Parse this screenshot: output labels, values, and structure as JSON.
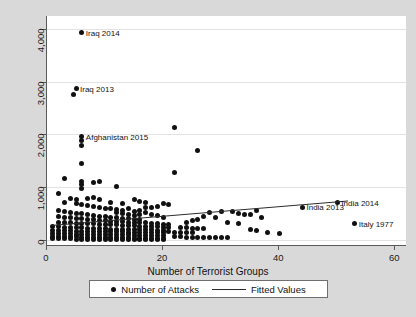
{
  "chart_data": {
    "type": "scatter",
    "title": "",
    "xlabel": "Number of Terrorist Groups",
    "ylabel": "",
    "xlim": [
      0,
      62
    ],
    "ylim": [
      -120,
      4250
    ],
    "grid": true,
    "xticks": [
      0,
      20,
      40,
      60
    ],
    "xtick_labels": [
      "0",
      "20",
      "40",
      "60"
    ],
    "yticks": [
      0,
      1000,
      2000,
      3000,
      4000
    ],
    "ytick_labels": [
      "0",
      "1,000",
      "2,000",
      "3,000",
      "4,000"
    ],
    "legend_position": "below-axes",
    "legend": [
      {
        "label": "Number of Attacks",
        "marker": "dot"
      },
      {
        "label": "Fitted Values",
        "marker": "line"
      }
    ],
    "series": [
      {
        "name": "Number of Attacks",
        "marker": "dot",
        "color": "#101010",
        "points": [
          [
            6,
            3930
          ],
          [
            5,
            2870
          ],
          [
            4.6,
            2760
          ],
          [
            6,
            1960
          ],
          [
            6,
            1880
          ],
          [
            6,
            1790
          ],
          [
            22,
            2130
          ],
          [
            26,
            1700
          ],
          [
            6,
            1440
          ],
          [
            22,
            1270
          ],
          [
            3,
            1170
          ],
          [
            6,
            1100
          ],
          [
            6,
            1050
          ],
          [
            8,
            1080
          ],
          [
            9,
            1110
          ],
          [
            12,
            1010
          ],
          [
            2,
            870
          ],
          [
            6,
            980
          ],
          [
            4,
            780
          ],
          [
            5,
            760
          ],
          [
            7,
            790
          ],
          [
            8,
            800
          ],
          [
            9,
            760
          ],
          [
            11,
            700
          ],
          [
            13,
            690
          ],
          [
            15,
            770
          ],
          [
            16,
            720
          ],
          [
            17,
            620
          ],
          [
            3,
            700
          ],
          [
            5,
            690
          ],
          [
            6,
            660
          ],
          [
            7,
            650
          ],
          [
            8,
            640
          ],
          [
            9,
            620
          ],
          [
            10,
            600
          ],
          [
            11,
            590
          ],
          [
            12,
            580
          ],
          [
            13,
            560
          ],
          [
            14,
            600
          ],
          [
            15,
            540
          ],
          [
            16,
            560
          ],
          [
            17,
            520
          ],
          [
            18,
            480
          ],
          [
            19,
            460
          ],
          [
            20,
            430
          ],
          [
            2,
            560
          ],
          [
            3,
            540
          ],
          [
            4,
            520
          ],
          [
            5,
            500
          ],
          [
            6,
            490
          ],
          [
            7,
            470
          ],
          [
            8,
            460
          ],
          [
            9,
            450
          ],
          [
            10,
            440
          ],
          [
            11,
            430
          ],
          [
            12,
            420
          ],
          [
            13,
            410
          ],
          [
            14,
            400
          ],
          [
            15,
            390
          ],
          [
            16,
            380
          ],
          [
            2,
            440
          ],
          [
            3,
            430
          ],
          [
            4,
            420
          ],
          [
            5,
            410
          ],
          [
            6,
            400
          ],
          [
            7,
            390
          ],
          [
            8,
            380
          ],
          [
            9,
            370
          ],
          [
            10,
            360
          ],
          [
            11,
            350
          ],
          [
            12,
            345
          ],
          [
            13,
            340
          ],
          [
            14,
            335
          ],
          [
            15,
            330
          ],
          [
            16,
            325
          ],
          [
            17,
            320
          ],
          [
            18,
            315
          ],
          [
            19,
            300
          ],
          [
            20,
            290
          ],
          [
            21,
            280
          ],
          [
            2,
            330
          ],
          [
            3,
            325
          ],
          [
            4,
            320
          ],
          [
            5,
            315
          ],
          [
            6,
            310
          ],
          [
            7,
            305
          ],
          [
            8,
            300
          ],
          [
            9,
            295
          ],
          [
            10,
            290
          ],
          [
            11,
            285
          ],
          [
            12,
            280
          ],
          [
            13,
            275
          ],
          [
            14,
            270
          ],
          [
            15,
            265
          ],
          [
            16,
            260
          ],
          [
            17,
            255
          ],
          [
            18,
            250
          ],
          [
            19,
            245
          ],
          [
            20,
            240
          ],
          [
            21,
            235
          ],
          [
            1,
            250
          ],
          [
            2,
            245
          ],
          [
            3,
            240
          ],
          [
            4,
            235
          ],
          [
            5,
            230
          ],
          [
            6,
            225
          ],
          [
            7,
            220
          ],
          [
            8,
            215
          ],
          [
            9,
            210
          ],
          [
            10,
            205
          ],
          [
            11,
            200
          ],
          [
            12,
            198
          ],
          [
            13,
            196
          ],
          [
            14,
            194
          ],
          [
            15,
            192
          ],
          [
            16,
            190
          ],
          [
            17,
            188
          ],
          [
            18,
            186
          ],
          [
            19,
            184
          ],
          [
            20,
            182
          ],
          [
            1,
            175
          ],
          [
            2,
            170
          ],
          [
            3,
            168
          ],
          [
            4,
            166
          ],
          [
            5,
            164
          ],
          [
            6,
            162
          ],
          [
            7,
            160
          ],
          [
            8,
            158
          ],
          [
            9,
            156
          ],
          [
            10,
            154
          ],
          [
            11,
            152
          ],
          [
            12,
            150
          ],
          [
            13,
            148
          ],
          [
            14,
            146
          ],
          [
            15,
            144
          ],
          [
            16,
            142
          ],
          [
            17,
            140
          ],
          [
            18,
            138
          ],
          [
            19,
            136
          ],
          [
            20,
            134
          ],
          [
            1,
            120
          ],
          [
            2,
            115
          ],
          [
            3,
            112
          ],
          [
            4,
            110
          ],
          [
            5,
            108
          ],
          [
            6,
            106
          ],
          [
            7,
            104
          ],
          [
            8,
            102
          ],
          [
            9,
            100
          ],
          [
            10,
            98
          ],
          [
            11,
            96
          ],
          [
            12,
            94
          ],
          [
            13,
            92
          ],
          [
            14,
            90
          ],
          [
            15,
            88
          ],
          [
            16,
            86
          ],
          [
            17,
            84
          ],
          [
            18,
            82
          ],
          [
            19,
            80
          ],
          [
            20,
            78
          ],
          [
            1,
            60
          ],
          [
            2,
            58
          ],
          [
            3,
            56
          ],
          [
            4,
            54
          ],
          [
            5,
            52
          ],
          [
            6,
            50
          ],
          [
            7,
            48
          ],
          [
            8,
            46
          ],
          [
            9,
            44
          ],
          [
            10,
            42
          ],
          [
            11,
            40
          ],
          [
            12,
            38
          ],
          [
            13,
            36
          ],
          [
            14,
            34
          ],
          [
            15,
            32
          ],
          [
            16,
            30
          ],
          [
            17,
            28
          ],
          [
            18,
            26
          ],
          [
            19,
            24
          ],
          [
            20,
            22
          ],
          [
            1,
            20
          ],
          [
            2,
            18
          ],
          [
            3,
            16
          ],
          [
            4,
            14
          ],
          [
            5,
            12
          ],
          [
            6,
            10
          ],
          [
            7,
            10
          ],
          [
            8,
            10
          ],
          [
            9,
            10
          ],
          [
            10,
            10
          ],
          [
            11,
            10
          ],
          [
            12,
            10
          ],
          [
            13,
            10
          ],
          [
            14,
            10
          ],
          [
            15,
            10
          ],
          [
            16,
            10
          ],
          [
            17,
            10
          ],
          [
            18,
            10
          ],
          [
            19,
            10
          ],
          [
            20,
            10
          ],
          [
            21,
            150
          ],
          [
            22,
            145
          ],
          [
            23,
            140
          ],
          [
            24,
            135
          ],
          [
            25,
            130
          ],
          [
            22,
            60
          ],
          [
            23,
            55
          ],
          [
            24,
            50
          ],
          [
            25,
            48
          ],
          [
            26,
            46
          ],
          [
            27,
            44
          ],
          [
            28,
            42
          ],
          [
            29,
            40
          ],
          [
            30,
            38
          ],
          [
            31,
            36
          ],
          [
            23,
            230
          ],
          [
            24,
            225
          ],
          [
            25,
            220
          ],
          [
            26,
            215
          ],
          [
            27,
            210
          ],
          [
            28,
            520
          ],
          [
            30,
            530
          ],
          [
            32,
            540
          ],
          [
            33,
            490
          ],
          [
            34,
            480
          ],
          [
            35,
            470
          ],
          [
            36,
            560
          ],
          [
            37,
            420
          ],
          [
            31,
            330
          ],
          [
            33,
            300
          ],
          [
            29,
            430
          ],
          [
            27,
            450
          ],
          [
            26,
            390
          ],
          [
            25,
            360
          ],
          [
            24,
            320
          ],
          [
            35,
            200
          ],
          [
            36,
            180
          ],
          [
            38,
            130
          ],
          [
            40,
            120
          ],
          [
            44,
            620
          ],
          [
            50,
            700
          ],
          [
            53,
            300
          ],
          [
            20,
            690
          ],
          [
            21,
            660
          ],
          [
            19,
            640
          ],
          [
            18,
            620
          ],
          [
            17,
            700
          ],
          [
            16,
            480
          ],
          [
            15,
            460
          ],
          [
            14,
            470
          ],
          [
            13,
            490
          ],
          [
            12,
            510
          ]
        ]
      }
    ],
    "fitted_line": {
      "name": "Fitted Values",
      "color": "#2a2a2a",
      "x_start": 1,
      "y_start": 255,
      "x_end": 52,
      "y_end": 720
    },
    "annotations": [
      {
        "text": "Iraq 2014",
        "x": 6,
        "y": 3930,
        "align": "right"
      },
      {
        "text": "Iraq 2013",
        "x": 5,
        "y": 2870,
        "align": "right"
      },
      {
        "text": "Afghanistan 2015",
        "x": 6,
        "y": 1960,
        "align": "right"
      },
      {
        "text": "India 2014",
        "x": 50,
        "y": 700,
        "align": "right"
      },
      {
        "text": "India 2013",
        "x": 44,
        "y": 620,
        "align": "right"
      },
      {
        "text": "Italy 1977",
        "x": 53,
        "y": 300,
        "align": "right"
      }
    ]
  }
}
